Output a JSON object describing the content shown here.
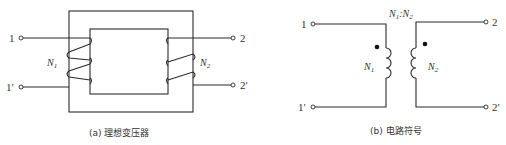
{
  "figure_a": {
    "caption": "(a) 理想变压器",
    "terminals": {
      "t1": "1",
      "t1p": "1′",
      "t2": "2",
      "t2p": "2′"
    },
    "winding1": {
      "letter": "N",
      "sub": "1"
    },
    "winding2": {
      "letter": "N",
      "sub": "2"
    }
  },
  "figure_b": {
    "caption": "(b) 电路符号",
    "ratio": {
      "n1": "N",
      "n1_sub": "1",
      "sep": ":",
      "n2": "N",
      "n2_sub": "2"
    },
    "terminals": {
      "t1": "1",
      "t1p": "1′",
      "t2": "2",
      "t2p": "2′"
    },
    "winding1": {
      "letter": "N",
      "sub": "1"
    },
    "winding2": {
      "letter": "N",
      "sub": "2"
    }
  }
}
